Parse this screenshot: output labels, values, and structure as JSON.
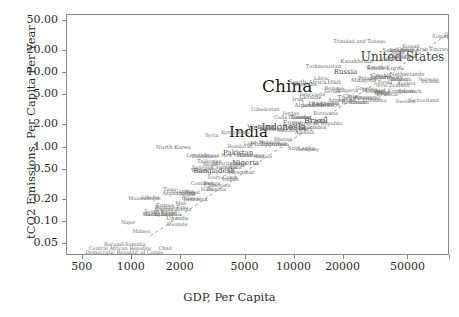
{
  "axes": {
    "xlabel": "GDP, Per Capita",
    "ylabel": "tCO2 Emissions, Per Capita Per Year",
    "xticklabels": [
      "500",
      "1000",
      "2000",
      "5000",
      "10000",
      "20000",
      "50000"
    ],
    "yticklabels": [
      "0.05",
      "0.10",
      "0.20",
      "0.50",
      "1.00",
      "2.00",
      "5.00",
      "10.00",
      "20.00",
      "50.00"
    ]
  },
  "colors": {
    "frame": "#8a8a8a",
    "background": "#ffffff",
    "tick_text": "#2b2b2b",
    "label_small": "#6e6e6e",
    "label_large": "#1a1a1a",
    "trendline": "#9a9a9a"
  },
  "chart_data": {
    "type": "scatter",
    "title": "",
    "xlabel": "GDP, Per Capita",
    "ylabel": "tCO2 Emissions, Per Capita Per Year",
    "xscale": "log",
    "yscale": "log",
    "xlim": [
      400,
      90000
    ],
    "ylim": [
      0.035,
      60
    ],
    "grid": false,
    "legend": null,
    "xticks": [
      500,
      1000,
      2000,
      5000,
      10000,
      20000,
      50000
    ],
    "yticks": [
      0.05,
      0.1,
      0.2,
      0.5,
      1.0,
      2.0,
      5.0,
      10.0,
      20.0,
      50.0
    ],
    "annotation_note": "Each point is labelled with a country name; text size scales with population.",
    "trendline": {
      "style": "dashed",
      "from": [
        1300,
        0.065
      ],
      "to": [
        85000,
        32
      ]
    },
    "points": [
      {
        "label": "China",
        "x": 9000,
        "y": 6.6,
        "size": 17
      },
      {
        "label": "India",
        "x": 5200,
        "y": 1.6,
        "size": 15
      },
      {
        "label": "United States",
        "x": 46000,
        "y": 16.5,
        "size": 12
      },
      {
        "label": "Indonesia",
        "x": 8600,
        "y": 1.9,
        "size": 9
      },
      {
        "label": "Brazil",
        "x": 13500,
        "y": 2.3,
        "size": 8
      },
      {
        "label": "Pakistan",
        "x": 4500,
        "y": 0.85,
        "size": 7
      },
      {
        "label": "Nigeria",
        "x": 5000,
        "y": 0.62,
        "size": 7
      },
      {
        "label": "Russia",
        "x": 20500,
        "y": 10.4,
        "size": 7
      },
      {
        "label": "Japan",
        "x": 33000,
        "y": 8.9,
        "size": 6.5
      },
      {
        "label": "Germany",
        "x": 38000,
        "y": 8.8,
        "size": 6
      },
      {
        "label": "Bangladesh",
        "x": 3200,
        "y": 0.48,
        "size": 7
      },
      {
        "label": "Mexico",
        "x": 16000,
        "y": 3.7,
        "size": 6.5
      },
      {
        "label": "Philippines",
        "x": 6900,
        "y": 1.1,
        "size": 6.5
      },
      {
        "label": "Vietnam",
        "x": 6200,
        "y": 1.9,
        "size": 6.5
      },
      {
        "label": "Ethiopia",
        "x": 1650,
        "y": 0.13,
        "size": 6.5
      },
      {
        "label": "Egypt",
        "x": 9700,
        "y": 2.1,
        "size": 6.5
      },
      {
        "label": "Iran",
        "x": 17500,
        "y": 7.6,
        "size": 6.5
      },
      {
        "label": "Turkey",
        "x": 21500,
        "y": 4.6,
        "size": 6.5
      },
      {
        "label": "Thailand",
        "x": 14500,
        "y": 3.8,
        "size": 6
      },
      {
        "label": "France",
        "x": 37000,
        "y": 5.2,
        "size": 6
      },
      {
        "label": "United Kingdom",
        "x": 38500,
        "y": 5.8,
        "size": 6
      },
      {
        "label": "Italy",
        "x": 34000,
        "y": 5.6,
        "size": 6
      },
      {
        "label": "South Africa",
        "x": 12000,
        "y": 7.5,
        "size": 6
      },
      {
        "label": "South Korea",
        "x": 36000,
        "y": 11.8,
        "size": 6
      },
      {
        "label": "Spain",
        "x": 34500,
        "y": 5.2,
        "size": 5.5
      },
      {
        "label": "Saudi Arabia",
        "x": 44500,
        "y": 19.5,
        "size": 5.5
      },
      {
        "label": "Canada",
        "x": 44000,
        "y": 15.8,
        "size": 5.5
      },
      {
        "label": "Australia",
        "x": 47000,
        "y": 16.2,
        "size": 5.5
      },
      {
        "label": "Poland",
        "x": 28000,
        "y": 8.2,
        "size": 5.5
      },
      {
        "label": "Argentina",
        "x": 19500,
        "y": 4.2,
        "size": 5.5
      },
      {
        "label": "Algeria",
        "x": 11500,
        "y": 3.6,
        "size": 5.5
      },
      {
        "label": "Malaysia",
        "x": 26500,
        "y": 7.9,
        "size": 5.5
      },
      {
        "label": "Ukraine",
        "x": 12500,
        "y": 4.6,
        "size": 5.5
      },
      {
        "label": "Colombia",
        "x": 13000,
        "y": 1.8,
        "size": 5.5
      },
      {
        "label": "Peru",
        "x": 11800,
        "y": 1.7,
        "size": 5.5
      },
      {
        "label": "Morocco",
        "x": 7200,
        "y": 1.7,
        "size": 5.5
      },
      {
        "label": "Kenya",
        "x": 3100,
        "y": 0.32,
        "size": 5.5
      },
      {
        "label": "Tanzania",
        "x": 2450,
        "y": 0.2,
        "size": 5.5
      },
      {
        "label": "Uganda",
        "x": 1900,
        "y": 0.11,
        "size": 5.5
      },
      {
        "label": "Sudan",
        "x": 4000,
        "y": 0.37,
        "size": 5.5
      },
      {
        "label": "Myanmar",
        "x": 4700,
        "y": 0.46,
        "size": 5.5
      },
      {
        "label": "Iraq",
        "x": 10500,
        "y": 4.3,
        "size": 5.5
      },
      {
        "label": "Afghanistan",
        "x": 1950,
        "y": 0.24,
        "size": 5.5
      },
      {
        "label": "Nepal",
        "x": 2350,
        "y": 0.25,
        "size": 5
      },
      {
        "label": "Uzbekistan",
        "x": 6600,
        "y": 3.3,
        "size": 5
      },
      {
        "label": "Venezuela",
        "x": 12800,
        "y": 5.3,
        "size": 5
      },
      {
        "label": "Saudi",
        "x": 43000,
        "y": 19.0,
        "size": 5
      },
      {
        "label": "Ghana",
        "x": 4200,
        "y": 0.54,
        "size": 5
      },
      {
        "label": "Mozambique",
        "x": 1200,
        "y": 0.21,
        "size": 5
      },
      {
        "label": "Madagascar",
        "x": 1450,
        "y": 0.13,
        "size": 5
      },
      {
        "label": "Cameroon",
        "x": 3350,
        "y": 0.31,
        "size": 5
      },
      {
        "label": "Ivory Coast",
        "x": 3600,
        "y": 0.4,
        "size": 5
      },
      {
        "label": "Niger",
        "x": 950,
        "y": 0.1,
        "size": 5
      },
      {
        "label": "Burkina Faso",
        "x": 1750,
        "y": 0.16,
        "size": 5
      },
      {
        "label": "Mali",
        "x": 2000,
        "y": 0.18,
        "size": 5
      },
      {
        "label": "Malawi",
        "x": 1150,
        "y": 0.075,
        "size": 5
      },
      {
        "label": "Zambia",
        "x": 3300,
        "y": 0.28,
        "size": 5
      },
      {
        "label": "Zimbabwe",
        "x": 2800,
        "y": 0.76,
        "size": 5
      },
      {
        "label": "Senegal",
        "x": 2700,
        "y": 0.55,
        "size": 5
      },
      {
        "label": "Chad",
        "x": 1600,
        "y": 0.045,
        "size": 5
      },
      {
        "label": "Somalia",
        "x": 1050,
        "y": 0.05,
        "size": 5
      },
      {
        "label": "Rwanda",
        "x": 1900,
        "y": 0.095,
        "size": 5
      },
      {
        "label": "Guinea",
        "x": 2300,
        "y": 0.21,
        "size": 5
      },
      {
        "label": "Benin",
        "x": 3050,
        "y": 0.6,
        "size": 5
      },
      {
        "label": "Burundi",
        "x": 780,
        "y": 0.05,
        "size": 5
      },
      {
        "label": "Haiti",
        "x": 2900,
        "y": 0.28,
        "size": 5
      },
      {
        "label": "Democratic Republic of Congo",
        "x": 900,
        "y": 0.04,
        "size": 5
      },
      {
        "label": "North Korea",
        "x": 1800,
        "y": 1.0,
        "size": 5.5
      },
      {
        "label": "Yemen",
        "x": 2600,
        "y": 0.5,
        "size": 5
      },
      {
        "label": "Syria",
        "x": 3100,
        "y": 1.45,
        "size": 5
      },
      {
        "label": "Cambodia",
        "x": 3700,
        "y": 0.55,
        "size": 5
      },
      {
        "label": "Laos",
        "x": 5300,
        "y": 1.15,
        "size": 5
      },
      {
        "label": "Sri Lanka",
        "x": 11000,
        "y": 0.95,
        "size": 5.5
      },
      {
        "label": "Chile",
        "x": 22000,
        "y": 4.7,
        "size": 5.5
      },
      {
        "label": "Ecuador",
        "x": 10800,
        "y": 2.5,
        "size": 5.5
      },
      {
        "label": "Guatemala",
        "x": 7600,
        "y": 1.1,
        "size": 5
      },
      {
        "label": "Bolivia",
        "x": 6700,
        "y": 1.9,
        "size": 5
      },
      {
        "label": "Cuba",
        "x": 8200,
        "y": 2.6,
        "size": 5
      },
      {
        "label": "Dominican Republic",
        "x": 13800,
        "y": 2.1,
        "size": 5
      },
      {
        "label": "Honduras",
        "x": 4600,
        "y": 1.05,
        "size": 5
      },
      {
        "label": "Paraguay",
        "x": 12000,
        "y": 0.95,
        "size": 5
      },
      {
        "label": "Nicaragua",
        "x": 5400,
        "y": 0.8,
        "size": 5
      },
      {
        "label": "Tunisia",
        "x": 10800,
        "y": 2.6,
        "size": 5
      },
      {
        "label": "Jordan",
        "x": 9500,
        "y": 2.9,
        "size": 5
      },
      {
        "label": "Azerbaijan",
        "x": 15500,
        "y": 3.9,
        "size": 5
      },
      {
        "label": "Kazakhstan",
        "x": 24000,
        "y": 14.0,
        "size": 5.5
      },
      {
        "label": "Belarus",
        "x": 17500,
        "y": 6.3,
        "size": 5
      },
      {
        "label": "Romania",
        "x": 23000,
        "y": 3.9,
        "size": 5.5
      },
      {
        "label": "Netherlands",
        "x": 49000,
        "y": 9.5,
        "size": 5.5
      },
      {
        "label": "Belgium",
        "x": 45000,
        "y": 8.4,
        "size": 5
      },
      {
        "label": "Sweden",
        "x": 48000,
        "y": 4.2,
        "size": 5
      },
      {
        "label": "Portugal",
        "x": 29000,
        "y": 4.6,
        "size": 5
      },
      {
        "label": "Greece",
        "x": 27000,
        "y": 6.2,
        "size": 5
      },
      {
        "label": "Czechia",
        "x": 34000,
        "y": 9.3,
        "size": 5
      },
      {
        "label": "Hungary",
        "x": 27500,
        "y": 4.7,
        "size": 5
      },
      {
        "label": "Austria",
        "x": 48500,
        "y": 7.4,
        "size": 5
      },
      {
        "label": "Switzerland",
        "x": 62000,
        "y": 4.3,
        "size": 5
      },
      {
        "label": "Israel",
        "x": 36000,
        "y": 7.5,
        "size": 5
      },
      {
        "label": "Norway",
        "x": 66000,
        "y": 8.2,
        "size": 5
      },
      {
        "label": "Denmark",
        "x": 51000,
        "y": 5.7,
        "size": 5
      },
      {
        "label": "Finland",
        "x": 43000,
        "y": 8.3,
        "size": 5
      },
      {
        "label": "Ireland",
        "x": 68000,
        "y": 7.7,
        "size": 5
      },
      {
        "label": "Singapore",
        "x": 84000,
        "y": 31.0,
        "size": 5
      },
      {
        "label": "Qatar",
        "x": 92000,
        "y": 33.0,
        "size": 5
      },
      {
        "label": "United Arab Emirates",
        "x": 63000,
        "y": 21.0,
        "size": 5
      },
      {
        "label": "Kuwait",
        "x": 52000,
        "y": 23.0,
        "size": 5
      },
      {
        "label": "Trinidad and Tobago",
        "x": 25000,
        "y": 26.5,
        "size": 5
      },
      {
        "label": "Oman",
        "x": 38000,
        "y": 15.5,
        "size": 5
      },
      {
        "label": "Bahrain",
        "x": 44000,
        "y": 20.5,
        "size": 5
      },
      {
        "label": "New Zealand",
        "x": 40000,
        "y": 7.0,
        "size": 5
      },
      {
        "label": "Bulgaria",
        "x": 21000,
        "y": 5.9,
        "size": 5
      },
      {
        "label": "Serbia",
        "x": 17000,
        "y": 5.7,
        "size": 5
      },
      {
        "label": "Slovakia",
        "x": 30000,
        "y": 6.0,
        "size": 5
      },
      {
        "label": "Croatia",
        "x": 25000,
        "y": 4.1,
        "size": 5
      },
      {
        "label": "Lithuania",
        "x": 31000,
        "y": 4.4,
        "size": 5
      },
      {
        "label": "Estonia",
        "x": 32000,
        "y": 12.0,
        "size": 5
      },
      {
        "label": "Mongolia",
        "x": 11500,
        "y": 7.2,
        "size": 5
      },
      {
        "label": "Turkmenistan",
        "x": 15000,
        "y": 12.5,
        "size": 5
      },
      {
        "label": "Libya",
        "x": 14500,
        "y": 8.6,
        "size": 5
      },
      {
        "label": "Lebanon",
        "x": 13000,
        "y": 3.7,
        "size": 5
      },
      {
        "label": "Georgia",
        "x": 11000,
        "y": 2.6,
        "size": 5
      },
      {
        "label": "Armenia",
        "x": 10000,
        "y": 1.9,
        "size": 5
      },
      {
        "label": "Moldova",
        "x": 7000,
        "y": 1.2,
        "size": 5
      },
      {
        "label": "Albania",
        "x": 11500,
        "y": 1.6,
        "size": 5
      },
      {
        "label": "Kyrgyzstan",
        "x": 4300,
        "y": 1.6,
        "size": 5
      },
      {
        "label": "Tajikistan",
        "x": 3000,
        "y": 0.65,
        "size": 5
      },
      {
        "label": "Bhutan",
        "x": 8500,
        "y": 1.3,
        "size": 5
      },
      {
        "label": "Papua New Guinea",
        "x": 3900,
        "y": 0.8,
        "size": 5
      },
      {
        "label": "Gabon",
        "x": 14000,
        "y": 2.3,
        "size": 5
      },
      {
        "label": "Botswana",
        "x": 15500,
        "y": 2.9,
        "size": 5
      },
      {
        "label": "Namibia",
        "x": 9000,
        "y": 1.7,
        "size": 5
      },
      {
        "label": "Angola",
        "x": 6400,
        "y": 0.78,
        "size": 5
      },
      {
        "label": "Congo",
        "x": 4500,
        "y": 0.6,
        "size": 5
      },
      {
        "label": "Mauritania",
        "x": 3800,
        "y": 0.62,
        "size": 5
      },
      {
        "label": "Eritrea",
        "x": 1600,
        "y": 0.17,
        "size": 5
      },
      {
        "label": "Liberia",
        "x": 1300,
        "y": 0.22,
        "size": 5
      },
      {
        "label": "Sierra Leone",
        "x": 1500,
        "y": 0.13,
        "size": 5
      },
      {
        "label": "Togo",
        "x": 1700,
        "y": 0.28,
        "size": 5
      },
      {
        "label": "Gambia",
        "x": 2100,
        "y": 0.26,
        "size": 5
      },
      {
        "label": "Lesotho",
        "x": 2500,
        "y": 0.8,
        "size": 5
      },
      {
        "label": "Central African Republic",
        "x": 850,
        "y": 0.045,
        "size": 5
      },
      {
        "label": "South Sudan",
        "x": 1500,
        "y": 0.14,
        "size": 5
      },
      {
        "label": "Guinea-Bissau",
        "x": 1800,
        "y": 0.15,
        "size": 5
      },
      {
        "label": "Comoros",
        "x": 2700,
        "y": 0.33,
        "size": 5
      },
      {
        "label": "Nepal2",
        "x": 2200,
        "y": 0.24,
        "size": 5
      }
    ]
  }
}
